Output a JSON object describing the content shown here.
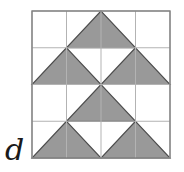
{
  "figure": {
    "label": "d",
    "label_position": {
      "x": 5,
      "y": 160
    },
    "colors": {
      "shade_fill": "#999999",
      "shade_stroke": "#4d4d4d",
      "grid_line": "#b3b3b3",
      "border": "#808080",
      "background": "#ffffff",
      "label_color": "#1a1a1a"
    },
    "square": {
      "left": 32,
      "top": 11,
      "right": 170,
      "bottom": 158,
      "divisions": 4
    },
    "grid": {
      "vertical_lines": [
        32,
        66.5,
        101,
        135.5,
        170
      ],
      "horizontal_lines": [
        11,
        47.75,
        84.5,
        121.25,
        158
      ]
    },
    "shaded_triangles": [
      {
        "name": "top-peak",
        "points": "101,11 66.5,47.75 135.5,47.75"
      },
      {
        "name": "upper-left-wing",
        "points": "66.5,47.75 32,84.5 101,84.5"
      },
      {
        "name": "upper-right-wing",
        "points": "135.5,47.75 101,84.5 170,84.5"
      },
      {
        "name": "middle-peak",
        "points": "101,84.5 66.5,121.25 135.5,121.25"
      },
      {
        "name": "lower-left-wing",
        "points": "66.5,121.25 32,158 101,158"
      },
      {
        "name": "lower-right-wing",
        "points": "135.5,121.25 101,158 170,158"
      }
    ]
  }
}
